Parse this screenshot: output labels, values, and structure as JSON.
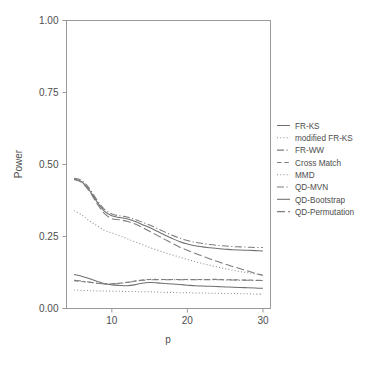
{
  "chart_data": {
    "type": "line",
    "title": "",
    "xlabel": "p",
    "ylabel": "Power",
    "xlim": [
      4,
      31
    ],
    "ylim": [
      0.0,
      1.0
    ],
    "grid": false,
    "legend_position": "right",
    "xticks": [
      10,
      20,
      30
    ],
    "xtick_labels": [
      "10",
      "20",
      "30"
    ],
    "yticks": [
      0.0,
      0.25,
      0.5,
      0.75,
      1.0
    ],
    "ytick_labels": [
      "0.00",
      "0.25",
      "0.50",
      "0.75",
      "1.00"
    ],
    "x": [
      5,
      6,
      7,
      8,
      9,
      10,
      11,
      12,
      13,
      14,
      15,
      16,
      17,
      18,
      19,
      20,
      21,
      22,
      23,
      24,
      25,
      26,
      27,
      28,
      29,
      30
    ],
    "series": [
      {
        "name": "FR-KS",
        "dash": "solid",
        "color": "#6f6f6f",
        "values": [
          0.118,
          0.112,
          0.104,
          0.095,
          0.086,
          0.082,
          0.08,
          0.079,
          0.082,
          0.088,
          0.09,
          0.089,
          0.087,
          0.085,
          0.083,
          0.081,
          0.079,
          0.078,
          0.077,
          0.076,
          0.075,
          0.074,
          0.073,
          0.072,
          0.071,
          0.07
        ]
      },
      {
        "name": "modified FR-KS",
        "dash": "dotted",
        "color": "#8a8a8a",
        "values": [
          0.064,
          0.063,
          0.062,
          0.061,
          0.061,
          0.06,
          0.06,
          0.059,
          0.059,
          0.058,
          0.058,
          0.057,
          0.056,
          0.056,
          0.055,
          0.055,
          0.054,
          0.054,
          0.053,
          0.053,
          0.052,
          0.052,
          0.051,
          0.051,
          0.05,
          0.05
        ]
      },
      {
        "name": "FR-WW",
        "dash": "dashdot",
        "color": "#7d7d7d",
        "values": [
          0.098,
          0.095,
          0.092,
          0.088,
          0.086,
          0.086,
          0.087,
          0.09,
          0.094,
          0.098,
          0.1,
          0.1,
          0.1,
          0.1,
          0.1,
          0.1,
          0.1,
          0.1,
          0.1,
          0.1,
          0.099,
          0.099,
          0.098,
          0.098,
          0.097,
          0.097
        ]
      },
      {
        "name": "Cross Match",
        "dash": "dashed",
        "color": "#7d7d7d",
        "values": [
          0.096,
          0.094,
          0.091,
          0.088,
          0.086,
          0.086,
          0.088,
          0.091,
          0.095,
          0.099,
          0.101,
          0.101,
          0.101,
          0.101,
          0.101,
          0.101,
          0.101,
          0.101,
          0.101,
          0.101,
          0.1,
          0.1,
          0.099,
          0.099,
          0.098,
          0.098
        ]
      },
      {
        "name": "MMD",
        "dash": "dotted",
        "color": "#8a8a8a",
        "values": [
          0.34,
          0.325,
          0.305,
          0.288,
          0.272,
          0.262,
          0.253,
          0.243,
          0.232,
          0.222,
          0.212,
          0.203,
          0.194,
          0.186,
          0.178,
          0.17,
          0.163,
          0.156,
          0.15,
          0.144,
          0.138,
          0.133,
          0.128,
          0.124,
          0.12,
          0.117
        ]
      },
      {
        "name": "QD-MVN",
        "dash": "dashdot",
        "color": "#7d7d7d",
        "values": [
          0.452,
          0.445,
          0.418,
          0.378,
          0.345,
          0.328,
          0.322,
          0.318,
          0.31,
          0.3,
          0.29,
          0.278,
          0.266,
          0.254,
          0.244,
          0.236,
          0.23,
          0.226,
          0.222,
          0.219,
          0.217,
          0.215,
          0.214,
          0.213,
          0.212,
          0.212
        ]
      },
      {
        "name": "QD-Bootstrap",
        "dash": "solid",
        "color": "#6f6f6f",
        "values": [
          0.45,
          0.44,
          0.412,
          0.372,
          0.338,
          0.322,
          0.316,
          0.312,
          0.303,
          0.292,
          0.281,
          0.268,
          0.255,
          0.243,
          0.232,
          0.224,
          0.218,
          0.214,
          0.211,
          0.208,
          0.206,
          0.204,
          0.203,
          0.202,
          0.201,
          0.2
        ]
      },
      {
        "name": "QD-Permutation",
        "dash": "longdash",
        "color": "#7d7d7d",
        "values": [
          0.448,
          0.438,
          0.408,
          0.366,
          0.33,
          0.312,
          0.308,
          0.303,
          0.294,
          0.282,
          0.268,
          0.254,
          0.24,
          0.226,
          0.213,
          0.202,
          0.192,
          0.182,
          0.172,
          0.163,
          0.154,
          0.146,
          0.138,
          0.13,
          0.122,
          0.115
        ]
      }
    ]
  },
  "axes": {
    "ylabel": "Power",
    "xlabel": "p"
  }
}
